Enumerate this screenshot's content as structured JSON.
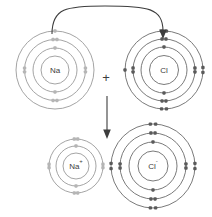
{
  "diagram": {
    "type": "chemistry-electron-shell-diagram",
    "width": 212,
    "height": 217,
    "background_color": "#ffffff"
  },
  "colors": {
    "ring_stroke": "#6b6b6b",
    "ring_stroke_faint": "#9a9a9a",
    "electron_fill": "#5a5a5a",
    "electron_fill_faint": "#b5b5b5",
    "label_color": "#3d3d3d",
    "arrow_color": "#3d3d3d"
  },
  "operators": {
    "plus_sign": "+",
    "plus_x": 106,
    "plus_y": 79
  },
  "arrows": [
    {
      "name": "electron-transfer-arrow",
      "kind": "curved",
      "from_label": "Na outer shell",
      "to_label": "Cl outer shell",
      "path": "M 52 34 C 52 8, 66 6, 105 6 C 148 6, 163 8, 163 31",
      "head_points": "163,39 159.2,29.5 166.8,29.5"
    },
    {
      "name": "reaction-arrow",
      "kind": "straight-down",
      "from_label": "reactants",
      "to_label": "products",
      "path": "M 107 96 L 107 131",
      "head_points": "107,139 103.2,129.5 110.8,129.5"
    }
  ],
  "atoms": [
    {
      "name": "sodium-atom",
      "symbol": "Na",
      "charge": "",
      "label": "Na",
      "role": "reactant",
      "faint": true,
      "cx": 55,
      "cy": 70,
      "nucleus_r": 14,
      "shells": [
        {
          "radius": 22,
          "electrons": 2,
          "label": "K shell"
        },
        {
          "radius": 30.5,
          "electrons": 8,
          "label": "L shell"
        },
        {
          "radius": 39,
          "electrons": 1,
          "label": "M shell"
        }
      ],
      "electron_configuration": "2,8,1",
      "total_electrons": 11
    },
    {
      "name": "chlorine-atom",
      "symbol": "Cl",
      "charge": "",
      "label": "Cl",
      "role": "reactant",
      "faint": false,
      "cx": 164,
      "cy": 70,
      "nucleus_r": 14.5,
      "shells": [
        {
          "radius": 23,
          "electrons": 2,
          "label": "K shell"
        },
        {
          "radius": 31,
          "electrons": 8,
          "label": "L shell"
        },
        {
          "radius": 39,
          "electrons": 7,
          "label": "M shell"
        }
      ],
      "electron_configuration": "2,8,7",
      "total_electrons": 17
    },
    {
      "name": "sodium-ion",
      "symbol": "Na",
      "charge": "+",
      "label": "Na",
      "role": "product",
      "faint": true,
      "cx": 76,
      "cy": 166,
      "nucleus_r": 13,
      "shells": [
        {
          "radius": 20,
          "electrons": 2,
          "label": "K shell"
        },
        {
          "radius": 27,
          "electrons": 8,
          "label": "L shell"
        }
      ],
      "electron_configuration": "2,8",
      "total_electrons": 10
    },
    {
      "name": "chloride-ion",
      "symbol": "Cl",
      "charge": "-",
      "label": "Cl",
      "role": "product",
      "faint": false,
      "cx": 153,
      "cy": 166,
      "nucleus_r": 15,
      "shells": [
        {
          "radius": 24,
          "electrons": 2,
          "label": "K shell"
        },
        {
          "radius": 33,
          "electrons": 8,
          "label": "L shell"
        },
        {
          "radius": 42,
          "electrons": 8,
          "label": "M shell"
        }
      ],
      "electron_configuration": "2,8,8",
      "total_electrons": 18
    }
  ]
}
